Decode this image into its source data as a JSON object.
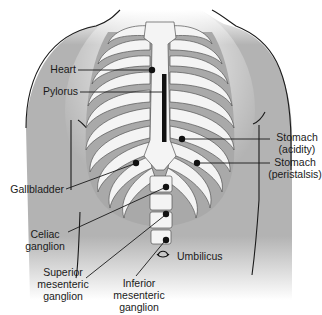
{
  "figure": {
    "type": "anatomical diagram",
    "colors": {
      "torso_fill": "#b3b3b3",
      "bone_fill": "#f4f4f4",
      "intercostal_fill": "#a9a9a9",
      "line": "#1a1a1a",
      "background": "#ffffff"
    }
  },
  "labels": {
    "heart": "Heart",
    "pylorus": "Pylorus",
    "stomach_acidity_1": "Stomach",
    "stomach_acidity_2": "(acidity)",
    "stomach_peristalsis_1": "Stomach",
    "stomach_peristalsis_2": "(peristalsis)",
    "gallbladder": "Gallbladder",
    "celiac_1": "Celiac",
    "celiac_2": "ganglion",
    "superior_1": "Superior",
    "superior_2": "mesenteric",
    "superior_3": "ganglion",
    "inferior_1": "Inferior",
    "inferior_2": "mesenteric",
    "inferior_3": "ganglion",
    "umbilicus": "Umbilicus"
  },
  "points": [
    {
      "name": "Heart",
      "x": 152,
      "y": 70
    },
    {
      "name": "Pylorus",
      "marker": "vertical bar",
      "x": 164,
      "y1": 74,
      "y2": 142
    },
    {
      "name": "Stomach (acidity)",
      "x": 182,
      "y": 139
    },
    {
      "name": "Stomach (peristalsis)",
      "x": 197,
      "y": 163
    },
    {
      "name": "Gallbladder",
      "x": 136,
      "y": 163
    },
    {
      "name": "Celiac ganglion",
      "x": 166,
      "y": 187
    },
    {
      "name": "Superior mesenteric ganglion",
      "x": 166,
      "y": 214
    },
    {
      "name": "Inferior mesenteric ganglion",
      "x": 166,
      "y": 240
    },
    {
      "name": "Umbilicus",
      "x": 163,
      "y": 253
    }
  ]
}
